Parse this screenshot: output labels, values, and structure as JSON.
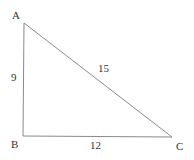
{
  "diagram": {
    "type": "right-triangle",
    "vertices": [
      {
        "label": "A",
        "x": 24,
        "y": 23
      },
      {
        "label": "B",
        "x": 23,
        "y": 136
      },
      {
        "label": "C",
        "x": 172,
        "y": 137
      }
    ],
    "sides": [
      {
        "name": "AB",
        "length_label": "9"
      },
      {
        "name": "AC",
        "length_label": "15"
      },
      {
        "name": "BC",
        "length_label": "12"
      }
    ],
    "line_color": "#888888"
  }
}
